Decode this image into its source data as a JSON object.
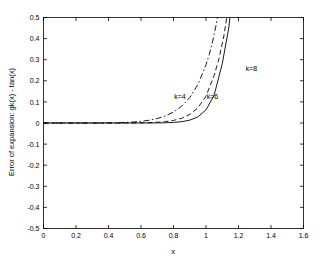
{
  "chart_data": {
    "type": "line",
    "title": "",
    "xlabel": "x",
    "ylabel": "Error of expansion:  gk(x) - tan(x)",
    "xlim": [
      0,
      1.6
    ],
    "ylim": [
      -0.5,
      0.5
    ],
    "xticks": [
      0,
      0.2,
      0.4,
      0.6,
      0.8,
      1,
      1.2,
      1.4,
      1.6
    ],
    "xticklabels": [
      "0",
      "0.2",
      "0.4",
      "0.6",
      "0.8",
      "1",
      "1.2",
      "1.4",
      "1.6"
    ],
    "yticks": [
      -0.5,
      -0.4,
      -0.3,
      -0.2,
      -0.1,
      0,
      0.1,
      0.2,
      0.3,
      0.4,
      0.5
    ],
    "yticklabels": [
      "-0.5",
      "-0.4",
      "-0.3",
      "-0.2",
      "-0.1",
      "0",
      "0.1",
      "0.2",
      "0.3",
      "0.4",
      "0.5"
    ],
    "grid": false,
    "legend_position": "inline-annotations",
    "background": "#ffffff",
    "axis_color": "#000000",
    "series": [
      {
        "name": "k=4",
        "linestyle": "dashdot",
        "color": "#000000",
        "label_text": "k=4",
        "label_x": 0.84,
        "label_y": 0.115,
        "x": [
          0,
          0.1,
          0.2,
          0.3,
          0.4,
          0.45,
          0.5,
          0.55,
          0.6,
          0.65,
          0.7,
          0.75,
          0.8,
          0.85,
          0.9,
          0.95,
          1.0,
          1.02,
          1.04,
          1.06,
          1.08,
          1.1,
          1.12,
          1.14
        ],
        "y": [
          0,
          0.0,
          0.0,
          0.0001,
          0.0007,
          0.0014,
          0.0026,
          0.0046,
          0.0079,
          0.0131,
          0.0212,
          0.0335,
          0.0519,
          0.0794,
          0.1204,
          0.182,
          0.276,
          0.325,
          0.384,
          0.456,
          0.544,
          0.653,
          0.788,
          0.957
        ]
      },
      {
        "name": "k=6",
        "linestyle": "dashed",
        "color": "#000000",
        "label_text": "k=6",
        "label_x": 1.04,
        "label_y": 0.115,
        "x": [
          0,
          0.1,
          0.2,
          0.3,
          0.4,
          0.5,
          0.55,
          0.6,
          0.65,
          0.7,
          0.75,
          0.8,
          0.85,
          0.9,
          0.95,
          1.0,
          1.05,
          1.08,
          1.11,
          1.14,
          1.17,
          1.2,
          1.22
        ],
        "y": [
          0,
          0.0,
          0.0,
          0.0,
          0.0,
          0.0002,
          0.0004,
          0.0008,
          0.0017,
          0.0034,
          0.0065,
          0.0122,
          0.0224,
          0.0404,
          0.072,
          0.1274,
          0.225,
          0.305,
          0.413,
          0.56,
          0.76,
          1.032,
          1.24
        ]
      },
      {
        "name": "k=8",
        "linestyle": "solid",
        "color": "#000000",
        "label_text": "k=8",
        "label_x": 1.28,
        "label_y": 0.245,
        "x": [
          0,
          0.1,
          0.2,
          0.3,
          0.4,
          0.5,
          0.6,
          0.65,
          0.7,
          0.75,
          0.8,
          0.85,
          0.9,
          0.95,
          1.0,
          1.05,
          1.1,
          1.14,
          1.18,
          1.22,
          1.26,
          1.29
        ],
        "y": [
          0,
          0.0,
          0.0,
          0.0,
          0.0,
          0.0,
          0.0001,
          0.0002,
          0.0005,
          0.0012,
          0.0028,
          0.0062,
          0.0135,
          0.029,
          0.062,
          0.132,
          0.281,
          0.45,
          0.72,
          1.15,
          1.84,
          2.5
        ]
      }
    ]
  }
}
